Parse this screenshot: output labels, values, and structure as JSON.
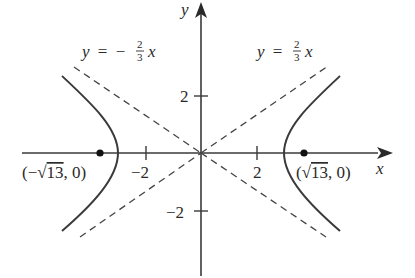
{
  "figure": {
    "type": "hyperbola-graph",
    "equation_implied": "x^2/9 - y^2/4 = 1",
    "axes": {
      "x_label": "x",
      "y_label": "y",
      "x_ticks": [
        {
          "value": -2,
          "label": "−2"
        },
        {
          "value": 2,
          "label": "2"
        }
      ],
      "y_ticks": [
        {
          "value": 2,
          "label": "2"
        },
        {
          "value": -2,
          "label": "−2"
        }
      ]
    },
    "asymptotes": [
      {
        "id": "positive",
        "label_lhs": "y =",
        "sign": "",
        "num": "2",
        "den": "3",
        "var": "x"
      },
      {
        "id": "negative",
        "label_lhs": "y =",
        "sign": "−",
        "num": "2",
        "den": "3",
        "var": "x"
      }
    ],
    "foci": [
      {
        "id": "left",
        "label_open": "(−",
        "radical": "√",
        "radicand": "13",
        "label_close": ", 0)"
      },
      {
        "id": "right",
        "label_open": "(",
        "radical": "√",
        "radicand": "13",
        "label_close": ", 0)"
      }
    ],
    "colors": {
      "curve": "#3a3a3a",
      "axis": "#3a3a3a",
      "asymptote": "#444444",
      "text": "#2a2a2a",
      "background": "#ffffff"
    }
  }
}
